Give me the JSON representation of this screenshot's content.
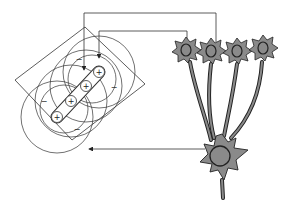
{
  "diagram": {
    "colors": {
      "line": "#333333",
      "neuron_fill": "#8a8a8a",
      "neuron_stroke": "#222222",
      "background": "#ffffff"
    },
    "receptive_field": {
      "center_sign": "+",
      "surround_sign": "−",
      "plus_labels": [
        "+",
        "+",
        "+",
        "+"
      ],
      "minus_labels": [
        "−",
        "−",
        "−",
        "−",
        "−",
        "−"
      ]
    },
    "input_neurons_count": 4,
    "output_neurons_count": 1,
    "arrows": [
      {
        "from": "input-neuron-2",
        "to": "receptive-field-center-3"
      },
      {
        "from": "input-neuron-1",
        "to": "receptive-field-center-4"
      },
      {
        "from": "output-neuron",
        "to": "receptive-field-frame"
      }
    ]
  }
}
